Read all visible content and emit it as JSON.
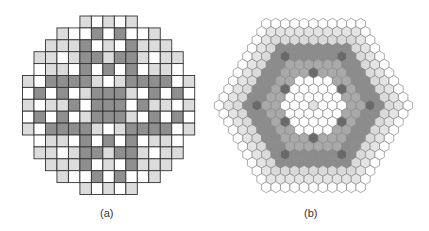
{
  "figures": {
    "a": {
      "caption": "(a)",
      "type": "square-lattice-core-map",
      "origin": [
        22.5,
        16
      ],
      "cell_w": 11.48,
      "cell_h": 11.9,
      "legend_colors": {
        "W": "#ffffff",
        "L": "#dcdcdc",
        "D": "#8f8f8f"
      },
      "grid_line_color": "#333333",
      "rows": [
        ".....LWLWL.....",
        "...LWWDWDWWL...",
        "..LLLDWLWDLLL..",
        ".LLWLDDLDDLWLL.",
        ".WLLWDWDWDWLLW.",
        "LWDDDDLWLDDDDWL",
        "WDWDWLDDDLWDWDW",
        "LWLLDWDDDWDLLWL",
        "WDWDWLDDDLWDWDW",
        "LWDDDDLWLDDDDWL",
        ".WLLWDWDWDWLLW.",
        ".LLWLDDLDDLWLL.",
        "..LLLDWLWDLLL..",
        "...LWWDWDWWL...",
        ".....LWLWL....."
      ]
    },
    "b": {
      "caption": "(b)",
      "type": "hexagonal-lattice-core-map",
      "center": [
        313.5,
        105.5
      ],
      "hex_size": 5.45,
      "radius": 10,
      "outline_color": "#8a8a8a",
      "ring_colors": {
        "0": "#e0e0e0",
        "1": "#ffffff",
        "2": "#ffffff",
        "3": "#ffffff",
        "4": "#a9a9a9",
        "5": "#a9a9a9",
        "6": "#8c8c8c",
        "7": "#8c8c8c",
        "8": "#dadada",
        "9": "#e4e4e4",
        "10": "#ffffff"
      },
      "dot_color": "#6a6a6a",
      "dot_positions": [
        [
          4,
          0
        ],
        [
          4,
          4
        ],
        [
          4,
          8
        ],
        [
          4,
          12
        ],
        [
          4,
          16
        ],
        [
          4,
          20
        ],
        [
          6,
          3
        ],
        [
          6,
          9
        ],
        [
          6,
          15
        ],
        [
          6,
          21
        ],
        [
          6,
          27
        ],
        [
          6,
          33
        ]
      ]
    }
  }
}
